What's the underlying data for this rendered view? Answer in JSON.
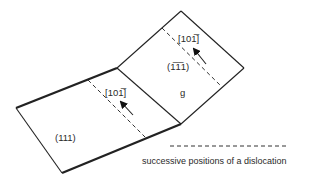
{
  "diagram": {
    "planes": [
      {
        "id": "primary",
        "label": "(111)"
      },
      {
        "id": "cross",
        "label": "(1̅1̅1)",
        "label_display": "(1 1̅ 1)",
        "grain_label": "g"
      }
    ],
    "burgers_vectors": [
      {
        "plane": "primary",
        "label": "[101̅]"
      },
      {
        "plane": "cross",
        "label": "[101̅]"
      }
    ],
    "legend": {
      "line_style": "dashed",
      "text": "successive positions of a dislocation"
    },
    "colors": {
      "line": "#222222",
      "text": "#2a2a2a",
      "background": "#ffffff"
    }
  }
}
